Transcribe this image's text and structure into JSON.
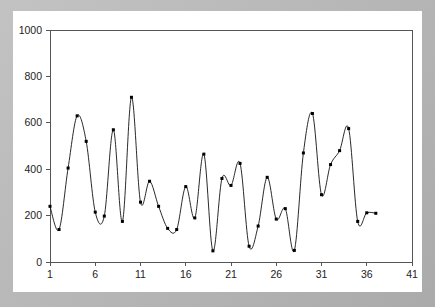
{
  "figure": {
    "mat_color": "#b5b5b5",
    "plot_background": "#ffffff",
    "line_color": "#111111",
    "marker_color": "#000000",
    "axis_color": "#555555"
  },
  "chart_data": {
    "type": "line",
    "title": "",
    "subtitle": "",
    "xlabel": "",
    "ylabel": "",
    "xlim": [
      1,
      41
    ],
    "ylim": [
      0,
      1000
    ],
    "grid": false,
    "legend": null,
    "markers": true,
    "smoothing": "spline",
    "x_ticks": [
      1,
      6,
      11,
      16,
      21,
      26,
      31,
      36,
      41
    ],
    "x_tick_labels": [
      "1",
      "6",
      "11",
      "16",
      "21",
      "26",
      "31",
      "36",
      "41"
    ],
    "y_ticks": [
      0,
      200,
      400,
      600,
      800,
      1000
    ],
    "y_tick_labels": [
      "0",
      "200",
      "400",
      "600",
      "800",
      "1000"
    ],
    "series": [
      {
        "name": "series-1",
        "x": [
          1,
          2,
          3,
          4,
          5,
          6,
          7,
          8,
          9,
          10,
          11,
          12,
          13,
          14,
          15,
          16,
          17,
          18,
          19,
          20,
          21,
          22,
          23,
          24,
          25,
          26,
          27,
          28,
          29,
          30,
          31,
          32,
          33,
          34,
          35,
          36,
          37
        ],
        "values": [
          240,
          140,
          405,
          630,
          520,
          215,
          198,
          570,
          175,
          710,
          258,
          348,
          240,
          145,
          140,
          325,
          190,
          465,
          48,
          360,
          330,
          425,
          68,
          155,
          365,
          185,
          230,
          50,
          470,
          640,
          290,
          420,
          480,
          575,
          175,
          212,
          210
        ]
      }
    ]
  }
}
